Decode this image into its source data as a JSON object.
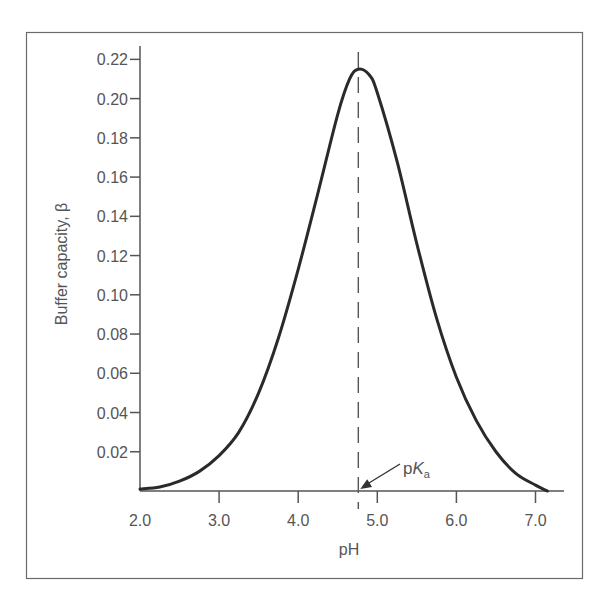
{
  "chart_data": {
    "type": "line",
    "title": "",
    "xlabel": "pH",
    "ylabel": "Buffer capacity, β",
    "xlim": [
      2.0,
      7.35
    ],
    "ylim": [
      0.0,
      0.225
    ],
    "grid": false,
    "legend": null,
    "x_ticks": [
      2.0,
      3.0,
      4.0,
      5.0,
      6.0,
      7.0
    ],
    "x_tick_labels": [
      "2.0",
      "3.0",
      "4.0",
      "5.0",
      "6.0",
      "7.0"
    ],
    "y_ticks": [
      0.02,
      0.04,
      0.06,
      0.08,
      0.1,
      0.12,
      0.14,
      0.16,
      0.18,
      0.2,
      0.22
    ],
    "y_tick_labels": [
      "0.02",
      "0.04",
      "0.06",
      "0.08",
      "0.10",
      "0.12",
      "0.14",
      "0.16",
      "0.18",
      "0.20",
      "0.22"
    ],
    "series": [
      {
        "name": "Buffer capacity",
        "x": [
          2.0,
          2.25,
          2.5,
          2.75,
          3.0,
          3.25,
          3.5,
          3.75,
          4.0,
          4.25,
          4.5,
          4.65,
          4.76,
          4.9,
          5.0,
          5.25,
          5.5,
          5.75,
          6.0,
          6.25,
          6.5,
          6.75,
          7.0,
          7.15
        ],
        "y": [
          0.001,
          0.002,
          0.005,
          0.01,
          0.018,
          0.03,
          0.05,
          0.078,
          0.113,
          0.152,
          0.192,
          0.21,
          0.215,
          0.212,
          0.203,
          0.168,
          0.126,
          0.088,
          0.058,
          0.036,
          0.02,
          0.009,
          0.003,
          0.0
        ]
      }
    ],
    "annotations": [
      {
        "type": "vline",
        "x": 4.76,
        "style": "dashed",
        "label": "pKa"
      },
      {
        "type": "arrow",
        "text_main": "p",
        "text_italic": "K",
        "text_sub": "a",
        "points_to_x": 4.76,
        "points_to_y": 0.0
      }
    ]
  },
  "labels": {
    "xlabel": "pH",
    "ylabel": "Buffer capacity, β",
    "pka_p": "p",
    "pka_K": "K",
    "pka_a": "a"
  },
  "colors": {
    "curve": "#2a2a2a",
    "axis": "#555555",
    "text": "#555555",
    "frame": "#6a6a6a"
  }
}
